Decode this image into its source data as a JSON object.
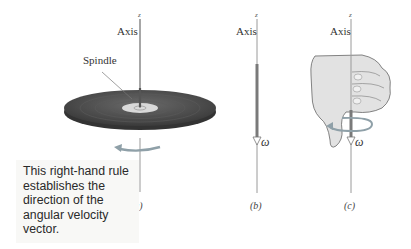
{
  "figure": {
    "panels": [
      {
        "id": "a",
        "label": "(a)",
        "axis_label": "Axis",
        "z_label": "z",
        "callout": "Spindle"
      },
      {
        "id": "b",
        "label": "(b)",
        "axis_label": "Axis",
        "z_label": "z",
        "vector_label": "ω⃗"
      },
      {
        "id": "c",
        "label": "(c)",
        "axis_label": "Axis",
        "z_label": "z",
        "vector_label": "ω⃗"
      }
    ],
    "caption": "This right-hand rule establishes the direction of the angular velocity vector.",
    "colors": {
      "disc": "#4a4a4a",
      "axis": "#8a8a8a",
      "hand": "#e2e2e2",
      "rotation_arrow": "#8fa0a8"
    }
  }
}
